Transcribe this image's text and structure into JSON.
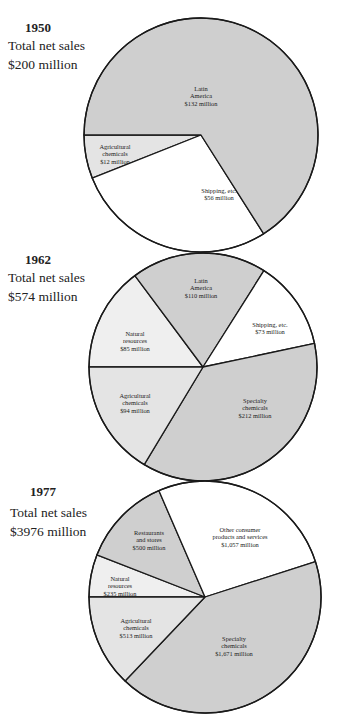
{
  "colors": {
    "dark": "#cfcfcf",
    "light": "#e4e4e4",
    "lighter": "#efefef",
    "white": "#ffffff",
    "stroke": "#1a1a1a"
  },
  "charts": [
    {
      "year": "1950",
      "caption_line1": "Total net sales",
      "caption_line2": "$200 million"
    },
    {
      "year": "1962",
      "caption_line1": "Total net sales",
      "caption_line2": "$574 million"
    },
    {
      "year": "1977",
      "caption_line1": "Total net sales",
      "caption_line2": "$3976 million"
    }
  ],
  "chart_data": [
    {
      "type": "pie",
      "title": "1950 Total net sales $200 million",
      "total": 200,
      "unit": "$ million",
      "categories": [
        "Latin America",
        "Agricultural chemicals",
        "Shipping, etc."
      ],
      "values": [
        132,
        12,
        56
      ],
      "labels": [
        [
          "Latin",
          "America",
          "$132 million"
        ],
        [
          "Agricultural",
          "chemicals",
          "$12 million"
        ],
        [
          "Shipping, etc.",
          "$56 million"
        ]
      ]
    },
    {
      "type": "pie",
      "title": "1962 Total net sales $574 million",
      "total": 574,
      "unit": "$ million",
      "categories": [
        "Natural resources",
        "Latin America",
        "Shipping, etc.",
        "Specialty chemicals",
        "Agricultural chemicals"
      ],
      "values": [
        85,
        110,
        73,
        212,
        94
      ],
      "labels": [
        [
          "Natural",
          "resources",
          "$85 million"
        ],
        [
          "Latin",
          "America",
          "$110 million"
        ],
        [
          "Shipping, etc.",
          "$73 million"
        ],
        [
          "Specialty",
          "chemicals",
          "$212 million"
        ],
        [
          "Agricultural",
          "chemicals",
          "$94 million"
        ]
      ]
    },
    {
      "type": "pie",
      "title": "1977 Total net sales $3976 million",
      "total": 3976,
      "unit": "$ million",
      "categories": [
        "Natural resources",
        "Restaurants and stores",
        "Other consumer products and services",
        "Specialty chemicals",
        "Agricultural chemicals"
      ],
      "values": [
        235,
        500,
        1057,
        1671,
        513
      ],
      "labels": [
        [
          "Natural",
          "resources",
          "$235 million"
        ],
        [
          "Restaurants",
          "and stores",
          "$500 million"
        ],
        [
          "Other consumer",
          "products and services",
          "$1,057 million"
        ],
        [
          "Specialty",
          "chemicals",
          "$1,671 million"
        ],
        [
          "Agricultural",
          "chemicals",
          "$513 million"
        ]
      ]
    }
  ]
}
